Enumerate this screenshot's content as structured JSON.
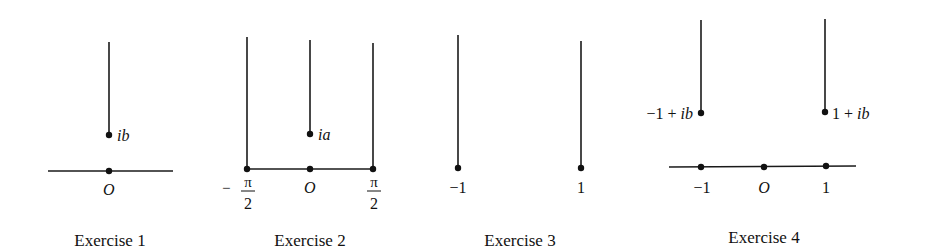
{
  "figures": [
    {
      "caption": "Exercise 1",
      "labels": {
        "point": "ib",
        "origin": "O"
      }
    },
    {
      "caption": "Exercise 2",
      "labels": {
        "point": "ia",
        "origin": "O",
        "left_minus": "−",
        "left_num": "π",
        "left_den": "2",
        "right_num": "π",
        "right_den": "2"
      }
    },
    {
      "caption": "Exercise 3",
      "labels": {
        "left": "−1",
        "right": "1"
      }
    },
    {
      "caption": "Exercise 4",
      "labels": {
        "left_point": "−1 + ib",
        "right_point_num": "1 + ",
        "right_point_im": "ib",
        "left_point_num": "−1 + ",
        "left_point_im": "ib",
        "tick_left": "−1",
        "tick_origin": "O",
        "tick_right": "1"
      }
    }
  ],
  "colors": {
    "ink": "#111111",
    "background": "#ffffff"
  }
}
